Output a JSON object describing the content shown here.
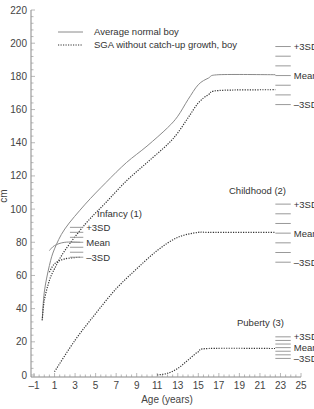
{
  "chart_data": {
    "type": "line",
    "title": "",
    "xlabel": "Age (years)",
    "ylabel": "cm",
    "xlim": [
      -1,
      25
    ],
    "ylim": [
      0,
      220
    ],
    "x_ticks": [
      -1,
      1,
      3,
      5,
      7,
      9,
      11,
      13,
      15,
      17,
      19,
      21,
      23,
      25
    ],
    "y_ticks": [
      0,
      20,
      40,
      60,
      80,
      100,
      120,
      140,
      160,
      180,
      200,
      220
    ],
    "grid": false,
    "legend": {
      "position": "upper-left",
      "entries": [
        {
          "label": "Average normal boy",
          "style": "solid"
        },
        {
          "label": "SGA without catch-up growth, boy",
          "style": "dotted"
        }
      ]
    },
    "series": [
      {
        "name": "Average normal boy (total height)",
        "style": "solid",
        "points": [
          [
            -0.2,
            33
          ],
          [
            0,
            50
          ],
          [
            0.5,
            66
          ],
          [
            1,
            76
          ],
          [
            2,
            88
          ],
          [
            4,
            103
          ],
          [
            6,
            116
          ],
          [
            8,
            128
          ],
          [
            10,
            138
          ],
          [
            12,
            149
          ],
          [
            13,
            156
          ],
          [
            14,
            166
          ],
          [
            15,
            175
          ],
          [
            16,
            179
          ],
          [
            17,
            181
          ],
          [
            22.5,
            181
          ]
        ]
      },
      {
        "name": "SGA without catch-up growth, boy (total height)",
        "style": "dotted",
        "points": [
          [
            -0.2,
            33
          ],
          [
            0,
            45
          ],
          [
            0.5,
            57
          ],
          [
            1,
            64
          ],
          [
            2,
            75
          ],
          [
            4,
            91
          ],
          [
            6,
            104
          ],
          [
            8,
            117
          ],
          [
            10,
            128
          ],
          [
            12,
            139
          ],
          [
            13,
            146
          ],
          [
            14,
            155
          ],
          [
            15,
            164
          ],
          [
            16,
            169
          ],
          [
            17,
            171.5
          ],
          [
            22.5,
            172
          ]
        ]
      },
      {
        "name": "Infancy component, normal",
        "style": "solid",
        "points": [
          [
            0.5,
            75
          ],
          [
            1,
            78
          ],
          [
            2,
            80
          ],
          [
            3.5,
            80
          ]
        ]
      },
      {
        "name": "Infancy component, SGA",
        "style": "dotted",
        "points": [
          [
            0.5,
            62
          ],
          [
            1,
            67
          ],
          [
            2,
            70
          ],
          [
            3.5,
            71
          ]
        ]
      },
      {
        "name": "Childhood component (2)",
        "style": "dotted",
        "points": [
          [
            1,
            2
          ],
          [
            3,
            21
          ],
          [
            5,
            37
          ],
          [
            7,
            52
          ],
          [
            9,
            64
          ],
          [
            11,
            75
          ],
          [
            13,
            83
          ],
          [
            15,
            86
          ],
          [
            16,
            86
          ],
          [
            22.5,
            86
          ]
        ]
      },
      {
        "name": "Puberty component (3)",
        "style": "dotted",
        "points": [
          [
            11,
            0
          ],
          [
            12,
            1
          ],
          [
            13,
            4
          ],
          [
            14,
            9
          ],
          [
            15,
            14
          ],
          [
            16,
            16
          ],
          [
            22.5,
            16
          ]
        ]
      }
    ],
    "annotations": [
      {
        "group": "Adult",
        "label": "",
        "sd_x": [
          22.5,
          24
        ],
        "sd_values": {
          "+3SD": 198,
          "Mean": 181,
          "-3SD": 163
        },
        "sd_lines": 7
      },
      {
        "group": "Infancy",
        "label": "Infancy (1)",
        "sd_x": [
          2.5,
          3.8
        ],
        "sd_values": {
          "+3SD": 89,
          "Mean": 80,
          "-3SD": 71
        },
        "sd_lines": 7
      },
      {
        "group": "Childhood",
        "label": "Childhood (2)",
        "sd_x": [
          22.5,
          24
        ],
        "sd_values": {
          "+3SD": 103,
          "Mean": 86,
          "-3SD": 68
        },
        "sd_lines": 7
      },
      {
        "group": "Puberty",
        "label": "Puberty (3)",
        "sd_x": [
          22.5,
          24
        ],
        "sd_values": {
          "+3SD": 23,
          "Mean": 17,
          "-3SD": 10
        },
        "sd_lines": 7
      }
    ]
  },
  "labels": {
    "plus3sd": "+3SD",
    "mean": "Mean",
    "minus3sd": "–3SD",
    "infancy": "Infancy (1)",
    "childhood": "Childhood (2)",
    "puberty": "Puberty (3)",
    "xlabel": "Age (years)",
    "ylabel": "cm",
    "legend_normal": "Average normal boy",
    "legend_sga": "SGA without catch-up growth, boy"
  }
}
